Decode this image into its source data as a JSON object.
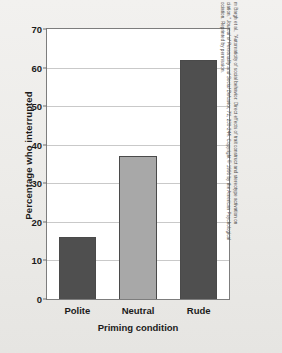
{
  "chart_data": {
    "type": "bar",
    "title": "",
    "xlabel": "Priming condition",
    "ylabel": "Percentage who interrupted",
    "categories": [
      "Polite",
      "Neutral",
      "Rude"
    ],
    "values": [
      16,
      37,
      62
    ],
    "ylim": [
      0,
      70
    ],
    "ytick_labels": [
      "0",
      "10",
      "20",
      "30",
      "40",
      "50",
      "60",
      "70"
    ],
    "ytick_values": [
      0,
      10,
      20,
      30,
      40,
      50,
      60,
      70
    ],
    "grid": true,
    "legend": "none",
    "bar_colors": [
      "#4f4f4f",
      "#a8a8a8",
      "#4f4f4f"
    ],
    "bar_border_color": "#4a4a4a",
    "plot_background": "#ffffff",
    "figure_background": "#efeeec"
  },
  "source_note": {
    "line1": "m Bargh et al., \"Automaticity of social behavior: Direct effects of trait construct and stereotype activation on",
    "line2_pre": "ciation,\" ",
    "line2_italic": "Journal of Personality and Social Behavior, 71,",
    "line2_post": " 230-244. Copyright © 1996 by the American Psychological",
    "line3": "ociation. Reprinted by permission."
  }
}
